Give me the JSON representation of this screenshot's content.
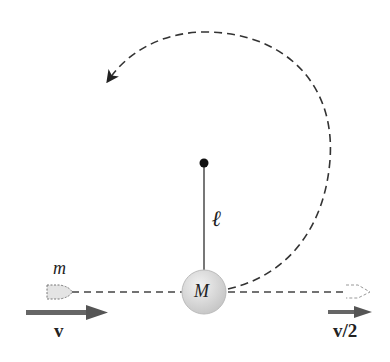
{
  "labels": {
    "projectile_mass": "m",
    "bob_mass": "M",
    "rod_length": "ℓ",
    "initial_velocity": "v",
    "final_velocity": "v/2"
  },
  "colors": {
    "line": "#333333",
    "arrow": "#555555",
    "bob_fill": "#d8d8d8",
    "projectile_fill": "#e4e4e4"
  }
}
